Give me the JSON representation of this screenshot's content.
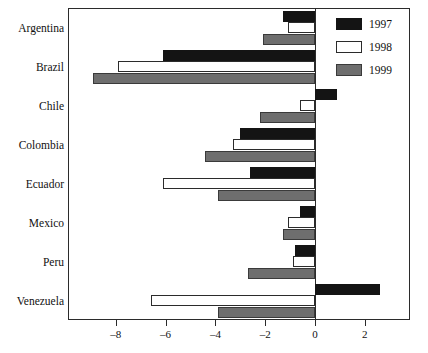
{
  "chart_data": {
    "type": "bar",
    "orientation": "horizontal",
    "title": "",
    "xlabel": "",
    "ylabel": "",
    "xlim": [
      -9.7,
      3.8
    ],
    "xticks": [
      -8,
      -6,
      -4,
      -2,
      0,
      2
    ],
    "xtick_labels": [
      "–8",
      "–6",
      "–4",
      "–2",
      "0",
      "2"
    ],
    "grid": false,
    "legend_position": "top-right",
    "categories": [
      "Argentina",
      "Brazil",
      "Chile",
      "Colombia",
      "Ecuador",
      "Mexico",
      "Peru",
      "Venezuela"
    ],
    "series": [
      {
        "name": "1997",
        "color": "#141414",
        "values": [
          -1.3,
          -6.1,
          0.9,
          -3.0,
          -2.6,
          -0.6,
          -0.8,
          2.6
        ]
      },
      {
        "name": "1998",
        "color": "#ffffff",
        "values": [
          -1.1,
          -7.9,
          -0.6,
          -3.3,
          -6.1,
          -1.1,
          -0.9,
          -6.6
        ]
      },
      {
        "name": "1999",
        "color": "#6e6e6e",
        "values": [
          -2.1,
          -8.9,
          -2.2,
          -4.4,
          -3.9,
          -1.3,
          -2.7,
          -3.9
        ]
      }
    ]
  },
  "legend": {
    "items": [
      {
        "label": "1997",
        "swatch": "black-swatch"
      },
      {
        "label": "1998",
        "swatch": "white-swatch"
      },
      {
        "label": "1999",
        "swatch": "gray-swatch"
      }
    ]
  }
}
